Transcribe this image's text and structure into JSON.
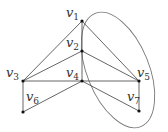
{
  "diagram": {
    "type": "graph",
    "nodes": [
      {
        "id": "v1",
        "label": "v",
        "sub": "1",
        "x": 82,
        "y": 21
      },
      {
        "id": "v2",
        "label": "v",
        "sub": "2",
        "x": 82,
        "y": 51
      },
      {
        "id": "v3",
        "label": "v",
        "sub": "3",
        "x": 23,
        "y": 81
      },
      {
        "id": "v4",
        "label": "v",
        "sub": "4",
        "x": 82,
        "y": 81
      },
      {
        "id": "v5",
        "label": "v",
        "sub": "5",
        "x": 139,
        "y": 81
      },
      {
        "id": "v6",
        "label": "v",
        "sub": "6",
        "x": 23,
        "y": 112
      },
      {
        "id": "v7",
        "label": "v",
        "sub": "7",
        "x": 139,
        "y": 111
      }
    ],
    "edges": [
      [
        "v1",
        "v3"
      ],
      [
        "v1",
        "v2"
      ],
      [
        "v1",
        "v5"
      ],
      [
        "v2",
        "v3"
      ],
      [
        "v2",
        "v4"
      ],
      [
        "v2",
        "v5"
      ],
      [
        "v3",
        "v4"
      ],
      [
        "v4",
        "v5"
      ],
      [
        "v3",
        "v6"
      ],
      [
        "v4",
        "v6"
      ],
      [
        "v4",
        "v7"
      ],
      [
        "v5",
        "v7"
      ]
    ],
    "enclosure": {
      "shape": "ellipse",
      "encloses": [
        "v1",
        "v4",
        "v5",
        "v7"
      ],
      "color": "#777777"
    },
    "colors": {
      "edge": "#555555",
      "node": "#111111",
      "label": "#333333"
    }
  }
}
